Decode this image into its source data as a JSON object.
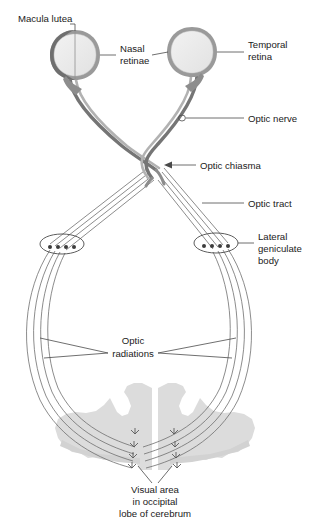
{
  "figure": {
    "background_color": "#ffffff",
    "width": 322,
    "height": 525
  },
  "colors": {
    "text": "#1a1a1a",
    "leader_line": "#4a4a4a",
    "eye_fill": "#ebebeb",
    "eye_rim_light": "#b4b4b4",
    "eye_rim_dark": "#7a7a7a",
    "nerve_dark": "#6b6b6b",
    "nerve_light": "#a8a8a8",
    "fiber": "#6e6e6e",
    "brain_fill": "#dcdcdc",
    "lgb_dot": "#3c3c3c"
  },
  "labels": {
    "macula_lutea": "Macula lutea",
    "nasal_retinae_line1": "Nasal",
    "nasal_retinae_line2": "retinae",
    "temporal_retina_line1": "Temporal",
    "temporal_retina_line2": "retina",
    "optic_nerve": "Optic nerve",
    "optic_chiasma": "Optic chiasma",
    "optic_tract": "Optic tract",
    "lateral_geniculate_body_line1": "Lateral",
    "lateral_geniculate_body_line2": "geniculate",
    "lateral_geniculate_body_line3": "body",
    "optic_radiations_line1": "Optic",
    "optic_radiations_line2": "radiations",
    "visual_area_line1": "Visual area",
    "visual_area_line2": "in occipital",
    "visual_area_line3": "lobe of cerebrum"
  },
  "structures": {
    "eyes": [
      {
        "name": "left-eye",
        "side": "left",
        "cx": 75,
        "cy": 55,
        "r": 24
      },
      {
        "name": "right-eye",
        "side": "right",
        "cx": 192,
        "cy": 52,
        "r": 24
      }
    ],
    "lateral_geniculate_bodies": [
      {
        "name": "left-lgb",
        "cx": 62,
        "cy": 244,
        "dots": 4
      },
      {
        "name": "right-lgb",
        "cx": 216,
        "cy": 243,
        "dots": 4
      }
    ],
    "optic_radiation_fiber_count": 4,
    "visual_cortex_terminal_count": 8
  }
}
